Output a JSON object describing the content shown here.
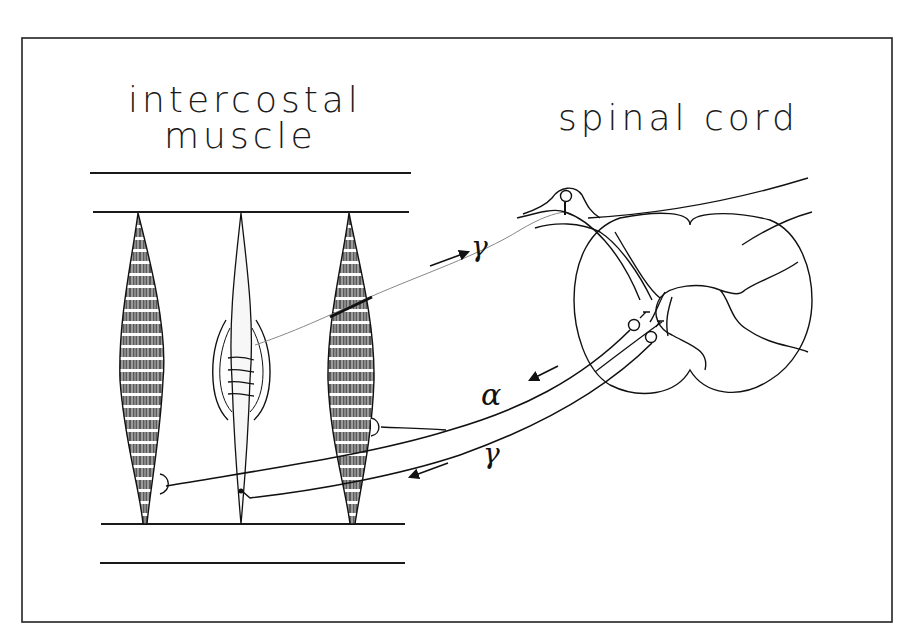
{
  "figure": {
    "type": "anatomical schematic",
    "frame": true,
    "colors": {
      "ink": "#1a1a1a",
      "background": "#ffffff",
      "muscle_fill": "#6e6e6e"
    }
  },
  "labels": {
    "muscle_line1": "intercostal",
    "muscle_line2": "muscle",
    "cord": "spinal cord",
    "gamma_afferent": "γ",
    "alpha_efferent": "α",
    "gamma_efferent": "γ"
  },
  "elements": {
    "muscle_fibers": [
      "extrafusal fiber (left)",
      "muscle spindle (intrafusal, center)",
      "extrafusal fiber (right)"
    ],
    "nerve_pathways": [
      {
        "name": "afferent fiber from spindle",
        "direction": "toward spinal cord",
        "label": "γ"
      },
      {
        "name": "alpha motor fiber",
        "direction": "toward muscle",
        "label": "α"
      },
      {
        "name": "gamma motor fiber",
        "direction": "toward muscle",
        "label": "γ"
      }
    ],
    "cord_parts": [
      "dorsal root ganglion",
      "grey matter (butterfly)",
      "ventral horn motor neurons"
    ]
  }
}
